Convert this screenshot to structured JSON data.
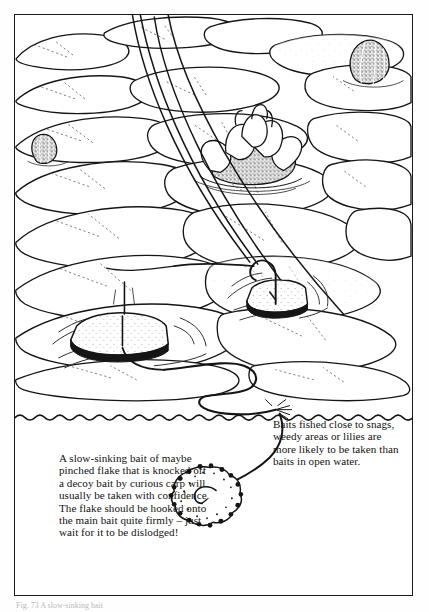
{
  "page": {
    "background_color": "#ffffff",
    "ink_color": "#111111"
  },
  "figure": {
    "frame": {
      "border_color": "#1a1a1a",
      "fill_color": "#ffffff"
    },
    "scene_title": "Carp fishing among lilies - surface and sub-surface view",
    "elements": {
      "water_surface_label": "water-surface-line",
      "lily_pads_label": "lily-pads",
      "lily_flower_label": "water-lily-flower",
      "lily_buds_label": "water-lily-buds",
      "floating_bait_left_label": "floating-crust-bait-left",
      "floating_bait_right_label": "floating-crust-bait-right",
      "sinking_bait_label": "sinking-flake-bait",
      "fishing_line_label": "fishing-line",
      "hook_label": "hook",
      "ripples_label": "surface-ripples"
    }
  },
  "captions": {
    "left": "A slow-sinking bait of maybe pinched flake that is knocked off a decoy bait by curious carp will usually be taken with confidence. The flake should be hooked onto the main bait quite firmly – just wait for it to be dislodged!",
    "right": "Baits fished close to snags, weedy areas or lilies are more likely to be taken than baits in open water."
  },
  "figure_caption": {
    "text": "Fig. 73 A slow-sinking bait"
  }
}
